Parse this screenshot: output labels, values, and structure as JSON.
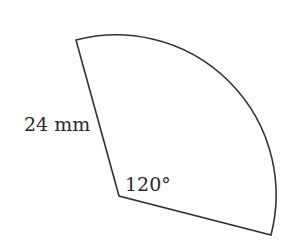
{
  "diagram": {
    "type": "circular-sector",
    "radius_label": "24 mm",
    "angle_label": "120°",
    "stroke_color": "#333333",
    "background": "#ffffff",
    "center": [
      119,
      196
    ],
    "radius_end_top": [
      76,
      40
    ],
    "radius_end_right": [
      271,
      235
    ]
  }
}
